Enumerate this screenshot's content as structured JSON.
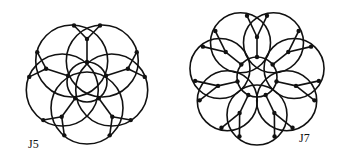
{
  "figures": [
    {
      "id": "J5",
      "label_main": "J",
      "label_sub": "5",
      "n": 5
    },
    {
      "id": "J7",
      "label_main": "J",
      "label_sub": "7",
      "n": 7
    }
  ]
}
